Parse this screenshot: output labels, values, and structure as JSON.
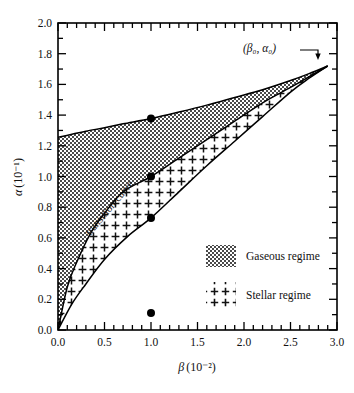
{
  "figure": {
    "background_color": "#ffffff",
    "line_color": "#000000"
  },
  "chart_data": {
    "type": "line",
    "title": "",
    "subtitle": "",
    "xlabel": "β (10⁻²)",
    "xlabel_symbol": "β",
    "xlabel_unit": "(10⁻²)",
    "ylabel": "α (10⁻¹)",
    "ylabel_symbol": "α",
    "ylabel_unit": "(10⁻¹)",
    "xlim": [
      0.0,
      3.0
    ],
    "ylim": [
      0.0,
      2.0
    ],
    "grid": false,
    "legend_position": "inside-lower-right",
    "x_major_ticks": [
      0.0,
      0.5,
      1.0,
      1.5,
      2.0,
      2.5,
      3.0
    ],
    "x_major_tick_labels": [
      "0.0",
      "0.5",
      "1.0",
      "1.5",
      "2.0",
      "2.5",
      "3.0"
    ],
    "x_minor_tick_step": 0.1,
    "y_major_ticks": [
      0.0,
      0.2,
      0.4,
      0.6,
      0.8,
      1.0,
      1.2,
      1.4,
      1.6,
      1.8,
      2.0
    ],
    "y_major_tick_labels": [
      "0.0",
      "0.2",
      "0.4",
      "0.6",
      "0.8",
      "1.0",
      "1.2",
      "1.4",
      "1.6",
      "1.8",
      "2.0"
    ],
    "y_minor_tick_step": 0.1,
    "series": [
      {
        "name": "upper-boundary",
        "description": "Upper boundary of gaseous regime",
        "x": [
          0.0,
          0.15,
          0.3,
          0.5,
          0.7,
          1.0,
          1.3,
          1.6,
          1.9,
          2.2,
          2.5,
          2.7,
          2.9
        ],
        "y": [
          1.255,
          1.275,
          1.295,
          1.318,
          1.343,
          1.378,
          1.42,
          1.465,
          1.515,
          1.565,
          1.625,
          1.67,
          1.72
        ]
      },
      {
        "name": "transition-curve",
        "description": "Transition curve separating gaseous and stellar regimes",
        "x": [
          0.0,
          0.1,
          0.2,
          0.35,
          0.5,
          0.7,
          1.0,
          1.3,
          1.6,
          1.9,
          2.2,
          2.5,
          2.7,
          2.9
        ],
        "y": [
          0.0,
          0.28,
          0.44,
          0.63,
          0.76,
          0.9,
          1.0,
          1.12,
          1.24,
          1.36,
          1.48,
          1.58,
          1.65,
          1.72
        ]
      },
      {
        "name": "lower-boundary",
        "description": "Lower boundary of stellar regime",
        "x": [
          0.0,
          0.15,
          0.3,
          0.5,
          0.75,
          1.0,
          1.3,
          1.6,
          1.9,
          2.2,
          2.5,
          2.7,
          2.9
        ],
        "y": [
          0.0,
          0.17,
          0.3,
          0.46,
          0.61,
          0.73,
          0.9,
          1.07,
          1.23,
          1.39,
          1.55,
          1.64,
          1.72
        ]
      }
    ],
    "markers": [
      {
        "name": "marker-upper",
        "x": 1.0,
        "y": 1.378,
        "shape": "filled-circle"
      },
      {
        "name": "marker-transition",
        "x": 1.0,
        "y": 1.0,
        "shape": "filled-circle"
      },
      {
        "name": "marker-lower",
        "x": 1.0,
        "y": 0.73,
        "shape": "filled-circle"
      },
      {
        "name": "marker-axis",
        "x": 1.0,
        "y": 0.11,
        "shape": "filled-circle"
      }
    ],
    "annotations": [
      {
        "name": "convergence-point-annotation",
        "text": "(β₀, α₀)",
        "x": 2.9,
        "y": 1.72,
        "has_arrow": true
      },
      {
        "name": "transition-curve-label",
        "text": "transition curve",
        "x": 0.55,
        "y": 0.82,
        "rotated": true
      }
    ],
    "regions": [
      {
        "name": "gaseous-regime",
        "label": "Gaseous regime",
        "pattern": "dots",
        "between": [
          "transition-curve",
          "upper-boundary"
        ]
      },
      {
        "name": "stellar-regime",
        "label": "Stellar regime",
        "pattern": "plus",
        "between": [
          "lower-boundary",
          "transition-curve"
        ]
      }
    ]
  },
  "legend": {
    "items": [
      {
        "label": "Gaseous regime",
        "pattern": "dots"
      },
      {
        "label": "Stellar regime",
        "pattern": "plus"
      }
    ]
  }
}
